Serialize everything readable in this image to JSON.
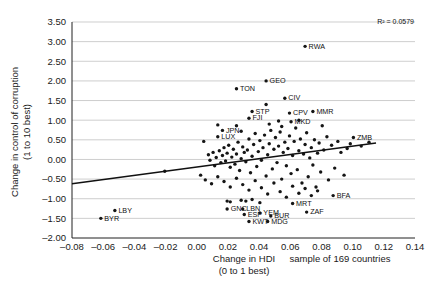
{
  "chart_data": {
    "type": "scatter",
    "title": "",
    "xlabel": "Change in HDI",
    "xlabel_sub": "(0 to 1 best)",
    "ylabel": "Change in control of corruption",
    "ylabel_sub": "(1 to 10 best)",
    "annotation": "R² = 0.0579",
    "annotation_r2_value": 0.0579,
    "sample_note": "sample of 169 countries",
    "sample_size": 169,
    "grid": true,
    "legend": "none",
    "xlim": [
      -0.08,
      0.14
    ],
    "ylim": [
      -2.0,
      3.5
    ],
    "xticks": [
      "-0.08",
      "-0.06",
      "-0.04",
      "-0.02",
      "0.00",
      "0.02",
      "0.04",
      "0.06",
      "0.08",
      "0.10",
      "0.12",
      "0.14"
    ],
    "xtick_values": [
      -0.08,
      -0.06,
      -0.04,
      -0.02,
      0.0,
      0.02,
      0.04,
      0.06,
      0.08,
      0.1,
      0.12,
      0.14
    ],
    "yticks": [
      "3.50",
      "3.00",
      "2.50",
      "2.00",
      "1.50",
      "1.00",
      "0.50",
      "0.00",
      "-0.50",
      "-1.00",
      "-1.50",
      "-2.00"
    ],
    "ytick_values": [
      3.5,
      3.0,
      2.5,
      2.0,
      1.5,
      1.0,
      0.5,
      0.0,
      -0.5,
      -1.0,
      -1.5,
      -2.0
    ],
    "trendline": {
      "x0": -0.08,
      "y0": -0.62,
      "x1": 0.115,
      "y1": 0.42
    },
    "labeled_points": [
      {
        "label": "RWA",
        "x": 0.0695,
        "y": 2.88
      },
      {
        "label": "TON",
        "x": 0.0255,
        "y": 1.8
      },
      {
        "label": "GEO",
        "x": 0.0445,
        "y": 2.0
      },
      {
        "label": "CIV",
        "x": 0.0565,
        "y": 1.56
      },
      {
        "label": "STP",
        "x": 0.0355,
        "y": 1.22
      },
      {
        "label": "FJI",
        "x": 0.0335,
        "y": 1.05
      },
      {
        "label": "CPV",
        "x": 0.0595,
        "y": 1.18
      },
      {
        "label": "MMR",
        "x": 0.0745,
        "y": 1.22
      },
      {
        "label": "MKD",
        "x": 0.0605,
        "y": 0.96
      },
      {
        "label": "JPN",
        "x": 0.0165,
        "y": 0.74
      },
      {
        "label": "LUX",
        "x": 0.0135,
        "y": 0.58
      },
      {
        "label": "ZMB",
        "x": 0.1005,
        "y": 0.56
      },
      {
        "label": "LBY",
        "x": -0.0525,
        "y": -1.3
      },
      {
        "label": "BYR",
        "x": -0.0615,
        "y": -1.5
      },
      {
        "label": "GNC",
        "x": 0.0195,
        "y": -1.26
      },
      {
        "label": "LBN",
        "x": 0.0295,
        "y": -1.26
      },
      {
        "label": "ESP",
        "x": 0.0305,
        "y": -1.4
      },
      {
        "label": "YEM",
        "x": 0.0405,
        "y": -1.36
      },
      {
        "label": "BUR",
        "x": 0.0475,
        "y": -1.44
      },
      {
        "label": "KWT",
        "x": 0.0335,
        "y": -1.58
      },
      {
        "label": "MDG",
        "x": 0.0455,
        "y": -1.58
      },
      {
        "label": "MRT",
        "x": 0.0615,
        "y": -1.12
      },
      {
        "label": "ZAF",
        "x": 0.0705,
        "y": -1.34
      },
      {
        "label": "BFA",
        "x": 0.0875,
        "y": -0.92
      }
    ],
    "unlabeled_points": [
      {
        "x": -0.0205,
        "y": -0.3
      },
      {
        "x": 0.0045,
        "y": 0.46
      },
      {
        "x": 0.0075,
        "y": 0.12
      },
      {
        "x": 0.0085,
        "y": -0.02
      },
      {
        "x": 0.0105,
        "y": 0.18
      },
      {
        "x": 0.0115,
        "y": -0.16
      },
      {
        "x": 0.0125,
        "y": 0.05
      },
      {
        "x": 0.0145,
        "y": 0.22
      },
      {
        "x": 0.0155,
        "y": -0.08
      },
      {
        "x": 0.0165,
        "y": 0.1
      },
      {
        "x": 0.0175,
        "y": 0.3
      },
      {
        "x": 0.0185,
        "y": -0.04
      },
      {
        "x": 0.0195,
        "y": 0.16
      },
      {
        "x": 0.0205,
        "y": 0.36
      },
      {
        "x": 0.0215,
        "y": -0.2
      },
      {
        "x": 0.0225,
        "y": 0.06
      },
      {
        "x": 0.0235,
        "y": 0.26
      },
      {
        "x": 0.0245,
        "y": -0.12
      },
      {
        "x": 0.0255,
        "y": 0.14
      },
      {
        "x": 0.0265,
        "y": 0.44
      },
      {
        "x": 0.0275,
        "y": -0.28
      },
      {
        "x": 0.0285,
        "y": 0.02
      },
      {
        "x": 0.0295,
        "y": 0.32
      },
      {
        "x": 0.0305,
        "y": 0.18
      },
      {
        "x": 0.0315,
        "y": -0.06
      },
      {
        "x": 0.0325,
        "y": 0.24
      },
      {
        "x": 0.0335,
        "y": 0.52
      },
      {
        "x": 0.0345,
        "y": -0.34
      },
      {
        "x": 0.0355,
        "y": 0.08
      },
      {
        "x": 0.0365,
        "y": 0.38
      },
      {
        "x": 0.0375,
        "y": 0.66
      },
      {
        "x": 0.0385,
        "y": -0.18
      },
      {
        "x": 0.0395,
        "y": 0.2
      },
      {
        "x": 0.0405,
        "y": 0.48
      },
      {
        "x": 0.0415,
        "y": -0.02
      },
      {
        "x": 0.0425,
        "y": 0.3
      },
      {
        "x": 0.0435,
        "y": 0.62
      },
      {
        "x": 0.0445,
        "y": -0.42
      },
      {
        "x": 0.0455,
        "y": 0.12
      },
      {
        "x": 0.0465,
        "y": 0.4
      },
      {
        "x": 0.0475,
        "y": 0.74
      },
      {
        "x": 0.0485,
        "y": -0.24
      },
      {
        "x": 0.0495,
        "y": 0.26
      },
      {
        "x": 0.0505,
        "y": 0.56
      },
      {
        "x": 0.0515,
        "y": -0.08
      },
      {
        "x": 0.0525,
        "y": 0.34
      },
      {
        "x": 0.0535,
        "y": 0.7
      },
      {
        "x": 0.0545,
        "y": -0.5
      },
      {
        "x": 0.0555,
        "y": 0.18
      },
      {
        "x": 0.0565,
        "y": 0.44
      },
      {
        "x": 0.0575,
        "y": -0.16
      },
      {
        "x": 0.0585,
        "y": 0.28
      },
      {
        "x": 0.0595,
        "y": 0.6
      },
      {
        "x": 0.0605,
        "y": -0.36
      },
      {
        "x": 0.0615,
        "y": 0.1
      },
      {
        "x": 0.0625,
        "y": 0.46
      },
      {
        "x": 0.0635,
        "y": 0.8
      },
      {
        "x": 0.0645,
        "y": -0.26
      },
      {
        "x": 0.0655,
        "y": 0.22
      },
      {
        "x": 0.0665,
        "y": 0.52
      },
      {
        "x": 0.0675,
        "y": -0.6
      },
      {
        "x": 0.0685,
        "y": 0.14
      },
      {
        "x": 0.0695,
        "y": 0.38
      },
      {
        "x": 0.0705,
        "y": 0.68
      },
      {
        "x": 0.0715,
        "y": -0.44
      },
      {
        "x": 0.0725,
        "y": 0.04
      },
      {
        "x": 0.0735,
        "y": 0.3
      },
      {
        "x": 0.0745,
        "y": -0.14
      },
      {
        "x": 0.0755,
        "y": 0.5
      },
      {
        "x": 0.0765,
        "y": -0.7
      },
      {
        "x": 0.0775,
        "y": 0.16
      },
      {
        "x": 0.0785,
        "y": 0.42
      },
      {
        "x": 0.0795,
        "y": -0.32
      },
      {
        "x": 0.0815,
        "y": 0.24
      },
      {
        "x": 0.0835,
        "y": 0.58
      },
      {
        "x": 0.0845,
        "y": -0.52
      },
      {
        "x": 0.0865,
        "y": 0.36
      },
      {
        "x": 0.0885,
        "y": -0.22
      },
      {
        "x": 0.0905,
        "y": 0.46
      },
      {
        "x": 0.0925,
        "y": 0.18
      },
      {
        "x": 0.0945,
        "y": -0.4
      },
      {
        "x": 0.0965,
        "y": 0.28
      },
      {
        "x": 0.0985,
        "y": 0.4
      },
      {
        "x": 0.1055,
        "y": 0.34
      },
      {
        "x": 0.1105,
        "y": 0.44
      },
      {
        "x": 0.0025,
        "y": -0.4
      },
      {
        "x": 0.0055,
        "y": -0.52
      },
      {
        "x": 0.0095,
        "y": -0.62
      },
      {
        "x": 0.0135,
        "y": -0.44
      },
      {
        "x": 0.0175,
        "y": -0.56
      },
      {
        "x": 0.0215,
        "y": -0.7
      },
      {
        "x": 0.0255,
        "y": -0.48
      },
      {
        "x": 0.0295,
        "y": -0.64
      },
      {
        "x": 0.0335,
        "y": -0.78
      },
      {
        "x": 0.0375,
        "y": -0.54
      },
      {
        "x": 0.0415,
        "y": -0.72
      },
      {
        "x": 0.0455,
        "y": -0.88
      },
      {
        "x": 0.0495,
        "y": -0.6
      },
      {
        "x": 0.0535,
        "y": -0.82
      },
      {
        "x": 0.0575,
        "y": -0.96
      },
      {
        "x": 0.0615,
        "y": -0.68
      },
      {
        "x": 0.0655,
        "y": -0.86
      },
      {
        "x": 0.0695,
        "y": -0.74
      },
      {
        "x": 0.0735,
        "y": -0.92
      },
      {
        "x": 0.0775,
        "y": -0.8
      },
      {
        "x": 0.0195,
        "y": -1.06
      },
      {
        "x": 0.0215,
        "y": -1.08
      },
      {
        "x": 0.0285,
        "y": -1.04
      },
      {
        "x": 0.0315,
        "y": -1.06
      },
      {
        "x": 0.0405,
        "y": -1.1
      },
      {
        "x": 0.0355,
        "y": -1.02
      },
      {
        "x": 0.0135,
        "y": 0.88
      },
      {
        "x": 0.0255,
        "y": 0.86
      },
      {
        "x": 0.0465,
        "y": 0.9
      },
      {
        "x": 0.0545,
        "y": 0.84
      },
      {
        "x": 0.0285,
        "y": 0.72
      },
      {
        "x": 0.0445,
        "y": 1.4
      },
      {
        "x": 0.0525,
        "y": 0.98
      },
      {
        "x": 0.0655,
        "y": 1.0
      },
      {
        "x": 0.0805,
        "y": 0.86
      }
    ]
  }
}
